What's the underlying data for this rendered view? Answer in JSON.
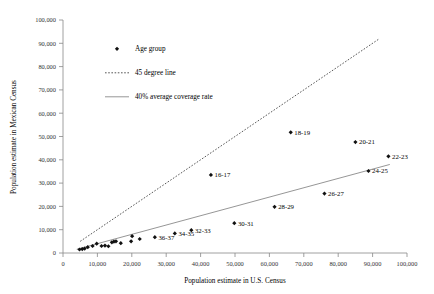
{
  "chart_data": {
    "type": "scatter",
    "title": "",
    "xlabel": "Population estimate in U.S. Census",
    "ylabel": "Population estimate in Mexican Census",
    "xlim": [
      0,
      100000
    ],
    "ylim": [
      0,
      100000
    ],
    "grid": false,
    "legend_position": "upper-left-inside",
    "x_ticks": [
      "0",
      "10,000",
      "20,000",
      "30,000",
      "40,000",
      "50,000",
      "60,000",
      "70,000",
      "80,000",
      "90,000",
      "100,000"
    ],
    "y_ticks": [
      "0",
      "10,000",
      "20,000",
      "30,000",
      "40,000",
      "50,000",
      "60,000",
      "70,000",
      "80,000",
      "90,000",
      "100,000"
    ],
    "x_tick_values": [
      0,
      10000,
      20000,
      30000,
      40000,
      50000,
      60000,
      70000,
      80000,
      90000,
      100000
    ],
    "y_tick_values": [
      0,
      10000,
      20000,
      30000,
      40000,
      50000,
      60000,
      70000,
      80000,
      90000,
      100000
    ],
    "series": [
      {
        "name": "Age group",
        "marker": "diamond",
        "color": "#111111",
        "points": [
          {
            "label": "",
            "x": 4800,
            "y": 1500
          },
          {
            "label": "",
            "x": 5600,
            "y": 1700
          },
          {
            "label": "",
            "x": 6300,
            "y": 1900
          },
          {
            "label": "",
            "x": 7200,
            "y": 2500
          },
          {
            "label": "",
            "x": 8600,
            "y": 3000
          },
          {
            "label": "",
            "x": 9800,
            "y": 4000
          },
          {
            "label": "",
            "x": 11200,
            "y": 3000
          },
          {
            "label": "",
            "x": 12200,
            "y": 3200
          },
          {
            "label": "",
            "x": 13200,
            "y": 2900
          },
          {
            "label": "",
            "x": 14200,
            "y": 4600
          },
          {
            "label": "",
            "x": 14800,
            "y": 4900
          },
          {
            "label": "",
            "x": 15400,
            "y": 5000
          },
          {
            "label": "",
            "x": 16800,
            "y": 4200
          },
          {
            "label": "",
            "x": 19800,
            "y": 5000
          },
          {
            "label": "",
            "x": 20100,
            "y": 7200
          },
          {
            "label": "",
            "x": 22300,
            "y": 6000
          },
          {
            "label": "36-37",
            "x": 26700,
            "y": 6800
          },
          {
            "label": "34-35",
            "x": 32500,
            "y": 8400
          },
          {
            "label": "32-33",
            "x": 37300,
            "y": 9800
          },
          {
            "label": "30-31",
            "x": 49800,
            "y": 12800
          },
          {
            "label": "28-29",
            "x": 61500,
            "y": 19800
          },
          {
            "label": "26-27",
            "x": 76000,
            "y": 25500
          },
          {
            "label": "24-25",
            "x": 88800,
            "y": 35200
          },
          {
            "label": "22-23",
            "x": 94600,
            "y": 41500
          },
          {
            "label": "20-21",
            "x": 85000,
            "y": 47600
          },
          {
            "label": "18-19",
            "x": 66200,
            "y": 51800
          },
          {
            "label": "16-17",
            "x": 43000,
            "y": 33500
          }
        ]
      }
    ],
    "reference_lines": [
      {
        "name": "45 degree line",
        "style": "dotted",
        "color": "#444444",
        "x0": 5000,
        "y0": 5000,
        "x1": 92000,
        "y1": 92000
      },
      {
        "name": "40% average coverage rate",
        "style": "solid",
        "color": "#8a8a8a",
        "x0": 4000,
        "y0": 1600,
        "x1": 95000,
        "y1": 38000
      }
    ],
    "legend": [
      {
        "label": "Age group",
        "symbol": "diamond",
        "color": "#111111"
      },
      {
        "label": "45 degree line",
        "symbol": "dotted-line",
        "color": "#444444"
      },
      {
        "label": "40% average coverage rate",
        "symbol": "solid-line",
        "color": "#8a8a8a"
      }
    ]
  }
}
